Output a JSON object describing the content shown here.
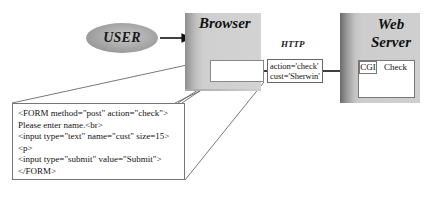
{
  "user": {
    "label": "USER"
  },
  "browser": {
    "label": "Browser"
  },
  "http": {
    "label": "HTTP"
  },
  "request": {
    "lines": [
      "action='check'",
      "cust='Sherwin'"
    ]
  },
  "server": {
    "label_line1": "Web",
    "label_line2": "Server",
    "cgi_label": "CGI",
    "program_label": "Check"
  },
  "form_source": {
    "lines": [
      "<FORM method=\"post\" action=\"check\">",
      "Please enter name.<br>",
      "<input type=\"text\" name=\"cust\" size=15>",
      "<p>",
      "<input type=\"submit\" value=\"Submit\">",
      "</FORM>"
    ]
  },
  "colors": {
    "line": "#555555",
    "arrow": "#111111",
    "box_fill": "#d0d0d0"
  }
}
